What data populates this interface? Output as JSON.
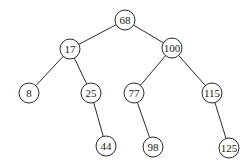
{
  "diagram": {
    "type": "binary-search-tree",
    "node_radius": 10,
    "colors": {
      "stroke": "#2a2a2a",
      "fill": "#ffffff",
      "text": "#1a1a1a"
    },
    "nodes": [
      {
        "id": "n68",
        "label": "68",
        "x": 125,
        "y": 20
      },
      {
        "id": "n17",
        "label": "17",
        "x": 70,
        "y": 49
      },
      {
        "id": "n100",
        "label": "100",
        "x": 172,
        "y": 48
      },
      {
        "id": "n8",
        "label": "8",
        "x": 29,
        "y": 93
      },
      {
        "id": "n25",
        "label": "25",
        "x": 91,
        "y": 93
      },
      {
        "id": "n77",
        "label": "77",
        "x": 134,
        "y": 93
      },
      {
        "id": "n115",
        "label": "115",
        "x": 212,
        "y": 93
      },
      {
        "id": "n44",
        "label": "44",
        "x": 106,
        "y": 146
      },
      {
        "id": "n98",
        "label": "98",
        "x": 153,
        "y": 147
      },
      {
        "id": "n125",
        "label": "125",
        "x": 229,
        "y": 148
      }
    ],
    "edges": [
      [
        "n68",
        "n17"
      ],
      [
        "n68",
        "n100"
      ],
      [
        "n17",
        "n8"
      ],
      [
        "n17",
        "n25"
      ],
      [
        "n100",
        "n77"
      ],
      [
        "n100",
        "n115"
      ],
      [
        "n25",
        "n44"
      ],
      [
        "n77",
        "n98"
      ],
      [
        "n115",
        "n125"
      ]
    ]
  }
}
